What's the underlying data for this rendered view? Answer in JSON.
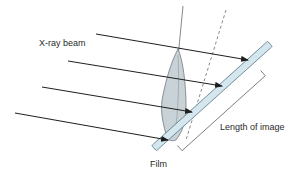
{
  "labels": {
    "beam": "X-ray beam",
    "image_length": "Length of image",
    "film": "Film"
  },
  "colors": {
    "line": "#1e1e1e",
    "tooth_fill": "#c9d2d6",
    "tooth_stroke": "#6f7a80",
    "film_fill": "#d4e6ee",
    "film_stroke": "#5d7d8a",
    "bracket": "#6a6a6a",
    "text": "#2a2a2a"
  },
  "arrows": [
    {
      "x1": 96,
      "y1": 34,
      "x2": 248,
      "y2": 60
    },
    {
      "x1": 68,
      "y1": 61,
      "x2": 222,
      "y2": 86
    },
    {
      "x1": 42,
      "y1": 87,
      "x2": 192,
      "y2": 112
    },
    {
      "x1": 15,
      "y1": 113,
      "x2": 168,
      "y2": 140
    }
  ]
}
